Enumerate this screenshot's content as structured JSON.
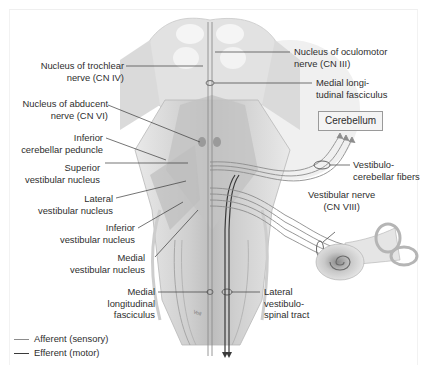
{
  "figure": {
    "labels_left": [
      {
        "id": "trochlear",
        "text": [
          "Nucleus of trochlear",
          "nerve (CN IV)"
        ]
      },
      {
        "id": "abducent",
        "text": [
          "Nucleus of abducent",
          "nerve (CN VI)"
        ]
      },
      {
        "id": "inf-cereb-peduncle",
        "text": [
          "Inferior",
          "cerebellar peduncle"
        ]
      },
      {
        "id": "sup-vest-nucleus",
        "text": [
          "Superior",
          "vestibular nucleus"
        ]
      },
      {
        "id": "lat-vest-nucleus",
        "text": [
          "Lateral",
          "vestibular nucleus"
        ]
      },
      {
        "id": "inf-vest-nucleus",
        "text": [
          "Inferior",
          "vestibular nucleus"
        ]
      },
      {
        "id": "med-vest-nucleus",
        "text": [
          "Medial",
          "vestibular nucleus"
        ]
      },
      {
        "id": "mlf-lower",
        "text": [
          "Medial",
          "longitudinal",
          "fasciculus"
        ]
      }
    ],
    "labels_right": [
      {
        "id": "oculomotor",
        "text": [
          "Nucleus of oculomotor",
          "nerve (CN III)"
        ]
      },
      {
        "id": "mlf-upper",
        "text": [
          "Medial longi-",
          "tudinal fasciculus"
        ]
      },
      {
        "id": "vestibulocerebellar",
        "text": [
          "Vestibulo-",
          "cerebellar fibers"
        ]
      },
      {
        "id": "vestibular-nerve",
        "text": [
          "Vestibular nerve",
          "(CN VIII)"
        ]
      },
      {
        "id": "lat-vestibulospinal",
        "text": [
          "Lateral",
          "vestibulo-",
          "spinal tract"
        ]
      }
    ],
    "box_label": "Cerebellum",
    "legend": [
      {
        "label": "Afferent (sensory)",
        "color": "#8c8c8c"
      },
      {
        "label": "Efferent (motor)",
        "color": "#3a3a3a"
      }
    ],
    "signature": "Voll"
  }
}
